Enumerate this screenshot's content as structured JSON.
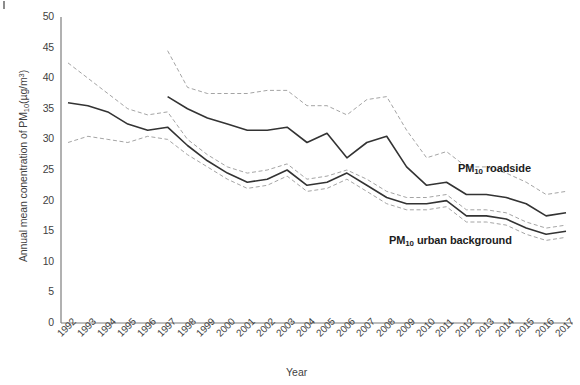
{
  "figure": {
    "corner_mark": "tick-mark"
  },
  "chart_data": {
    "type": "line",
    "title": "",
    "xlabel": "Year",
    "ylabel": "Annual mean conentration of PM10(µg/m3)",
    "ylabel_parts": {
      "prefix": "Annual mean conentration of PM",
      "sub": "10",
      "unit_open": "(µg/m",
      "sup": "3",
      "unit_close": ")"
    },
    "xlabel_text": "Year",
    "grid": false,
    "legend_position": "inline-annotation",
    "ylim": [
      0,
      50
    ],
    "yticks": [
      0,
      5,
      10,
      15,
      20,
      25,
      30,
      35,
      40,
      45,
      50
    ],
    "categories": [
      "1992",
      "1993",
      "1994",
      "1995",
      "1996",
      "1997",
      "1998",
      "1999",
      "2000",
      "2001",
      "2002",
      "2003",
      "2004",
      "2005",
      "2006",
      "2007",
      "2008",
      "2009",
      "2010",
      "2011",
      "2012",
      "2013",
      "2014",
      "2015",
      "2016",
      "2017"
    ],
    "series": [
      {
        "name": "PM10 roadside",
        "label_prefix": "PM",
        "label_sub": "10",
        "label_suffix": " roadside",
        "style": "solid",
        "color": "#333333",
        "values": [
          null,
          null,
          null,
          null,
          null,
          37.0,
          35.0,
          33.5,
          32.5,
          31.5,
          31.5,
          32.0,
          29.5,
          31.0,
          27.0,
          29.5,
          30.5,
          25.5,
          22.5,
          23.0,
          21.0,
          21.0,
          20.5,
          19.5,
          17.5,
          18.0
        ]
      },
      {
        "name": "PM10 roadside upper bound",
        "style": "dashed",
        "color": "#9a9a9a",
        "values": [
          null,
          null,
          null,
          null,
          null,
          44.5,
          38.5,
          37.5,
          37.5,
          37.5,
          38.0,
          38.0,
          35.5,
          35.5,
          34.0,
          36.5,
          37.0,
          31.5,
          27.0,
          28.0,
          25.5,
          25.5,
          24.5,
          23.0,
          21.0,
          21.5
        ]
      },
      {
        "name": "PM10 urban background",
        "label_prefix": "PM",
        "label_sub": "10",
        "label_suffix": " urban background",
        "style": "solid",
        "color": "#333333",
        "values": [
          36.0,
          35.5,
          34.5,
          32.5,
          31.5,
          32.0,
          29.0,
          26.5,
          24.5,
          23.0,
          23.5,
          25.0,
          22.5,
          23.0,
          24.5,
          22.5,
          20.5,
          19.5,
          19.5,
          20.0,
          17.5,
          17.5,
          17.0,
          15.5,
          14.5,
          15.0
        ]
      },
      {
        "name": "PM10 urban background upper bound",
        "style": "dashed",
        "color": "#9a9a9a",
        "values": [
          42.5,
          40.0,
          37.5,
          35.0,
          34.0,
          34.5,
          30.0,
          27.5,
          25.5,
          24.5,
          25.0,
          26.0,
          23.5,
          24.0,
          25.0,
          23.5,
          21.5,
          20.5,
          20.5,
          21.0,
          18.5,
          18.5,
          18.0,
          16.5,
          15.5,
          16.0
        ]
      },
      {
        "name": "PM10 urban background lower bound",
        "style": "dashed",
        "color": "#9a9a9a",
        "values": [
          29.5,
          30.5,
          30.0,
          29.5,
          30.5,
          30.0,
          27.5,
          25.5,
          23.5,
          22.0,
          22.5,
          24.0,
          21.5,
          22.0,
          23.5,
          21.5,
          19.5,
          18.5,
          18.5,
          19.0,
          16.5,
          16.5,
          16.0,
          14.5,
          13.5,
          14.0
        ]
      }
    ]
  }
}
